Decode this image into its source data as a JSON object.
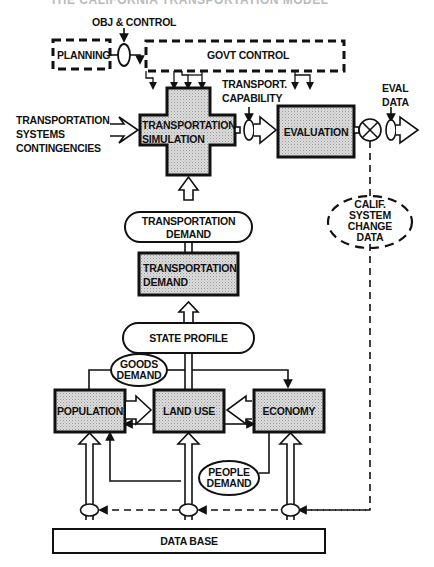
{
  "title": "THE CALIFORNIA TRANSPORTATION MODEL",
  "labels": {
    "obj_control": "OBJ & CONTROL",
    "planning": "PLANNING",
    "govt_control": "GOVT CONTROL",
    "transport_capability_1": "TRANSPORT.",
    "transport_capability_2": "CAPABILITY",
    "eval_data_1": "EVAL",
    "eval_data_2": "DATA",
    "contingencies_1": "TRANSPORTATION",
    "contingencies_2": "SYSTEMS",
    "contingencies_3": "CONTINGENCIES",
    "simulation_1": "TRANSPORTATION",
    "simulation_2": "SIMULATION",
    "evaluation": "EVALUATION",
    "calif_1": "CALIF.",
    "calif_2": "SYSTEM",
    "calif_3": "CHANGE",
    "calif_4": "DATA",
    "demand_oval_1": "TRANSPORTATION",
    "demand_oval_2": "DEMAND",
    "demand_box_1": "TRANSPORTATION",
    "demand_box_2": "DEMAND",
    "state_profile": "STATE PROFILE",
    "goods_demand_1": "GOODS",
    "goods_demand_2": "DEMAND",
    "population": "POPULATION",
    "land_use": "LAND USE",
    "economy": "ECONOMY",
    "people_demand_1": "PEOPLE",
    "people_demand_2": "DEMAND",
    "data_base": "DATA BASE"
  },
  "colors": {
    "ink": "#111111",
    "shade": "#d4d4d4",
    "background": "#ffffff"
  }
}
